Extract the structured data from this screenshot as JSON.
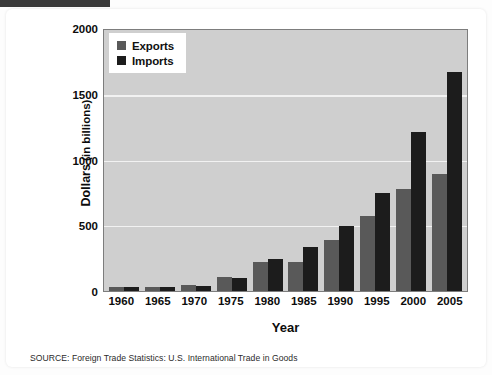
{
  "chart_data": {
    "type": "bar",
    "title": "",
    "subtitle": "",
    "xlabel": "Year",
    "ylabel": "Dollars (in billions)",
    "ylabel_main": "Dollars",
    "ylabel_unit": "(in billions)",
    "categories": [
      "1960",
      "1965",
      "1970",
      "1975",
      "1980",
      "1985",
      "1990",
      "1995",
      "2000",
      "2005"
    ],
    "series": [
      {
        "name": "Exports",
        "color": "#595959",
        "values": [
          20,
          27,
          43,
          108,
          221,
          219,
          394,
          575,
          782,
          895
        ]
      },
      {
        "name": "Imports",
        "color": "#1c1c1c",
        "values": [
          15,
          21,
          40,
          98,
          245,
          338,
          495,
          749,
          1216,
          1677
        ]
      }
    ],
    "ylim": [
      0,
      2000
    ],
    "yticks": [
      0,
      500,
      1000,
      1500,
      2000
    ],
    "ytick_labels": [
      "0",
      "500",
      "1000",
      "1500",
      "2000"
    ],
    "grid": true,
    "grid_axis": "y",
    "legend_position": "top-left",
    "plot_background": "#cfcfcf",
    "gridline_color": "#f2f2f2"
  },
  "legend": {
    "items": [
      {
        "label": "Exports",
        "color": "#595959"
      },
      {
        "label": "Imports",
        "color": "#1c1c1c"
      }
    ]
  },
  "axes": {
    "y_title_main": "Dollars",
    "y_title_unit": " (in billions)",
    "x_title": "Year",
    "y_tick_labels": [
      "2000",
      "1500",
      "1000",
      "500",
      "0"
    ],
    "x_tick_labels": [
      "1960",
      "1965",
      "1970",
      "1975",
      "1980",
      "1985",
      "1990",
      "1995",
      "2000",
      "2005"
    ]
  },
  "footer": {
    "source": "SOURCE: Foreign Trade Statistics: U.S. International Trade in Goods"
  }
}
